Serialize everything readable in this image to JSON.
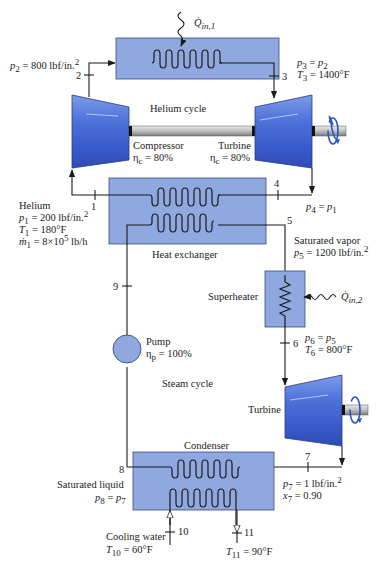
{
  "colors": {
    "box_fill": "#8fa8e0",
    "machine_blue": "#4a6fd6",
    "rotation_arrow": "#2a52c9",
    "shaft_gray": "#b9b9b9",
    "line": "#1a1a1a"
  },
  "components": {
    "helium_heater": {
      "heat_label": "Q̇",
      "heat_sub": "in,1"
    },
    "helium_cycle_label": "Helium cycle",
    "compressor": {
      "label": "Compressor",
      "eff": "ηc = 80%",
      "eff_sym": "η",
      "eff_sub": "c",
      "eff_val": " = 80%"
    },
    "helium_turbine": {
      "label": "Turbine",
      "eff_sym": "η",
      "eff_sub": "c",
      "eff_val": " = 80%"
    },
    "heat_exchanger": {
      "label": "Heat exchanger"
    },
    "superheater": {
      "label": "Superheater",
      "heat_label": "Q̇",
      "heat_sub": "in,2"
    },
    "pump": {
      "label": "Pump",
      "eff_sym": "η",
      "eff_sub": "p",
      "eff_val": " = 100%"
    },
    "steam_cycle_label": "Steam cycle",
    "steam_turbine": {
      "label": "Turbine"
    },
    "condenser": {
      "label": "Condenser"
    }
  },
  "states": {
    "s1": {
      "num": "1",
      "title": "Helium",
      "p": "p",
      "p_sub": "1",
      "p_val": " = 200 lbf/in.",
      "p_exp": "2",
      "T": "T",
      "T_sub": "1",
      "T_val": " = 180°F",
      "m": "ṁ",
      "m_sub": "1",
      "m_val": " = 8×10",
      "m_exp": "5",
      "m_unit": " lb/h"
    },
    "s2": {
      "num": "2",
      "p": "p",
      "p_sub": "2",
      "p_val": " = 800 lbf/in.",
      "p_exp": "2"
    },
    "s3": {
      "num": "3",
      "p": "p",
      "p_sub": "3",
      "p_eq": " = ",
      "p_rhs": "p",
      "p_rhs_sub": "2",
      "T": "T",
      "T_sub": "3",
      "T_val": " = 1400°F"
    },
    "s4": {
      "num": "4",
      "p": "p",
      "p_sub": "4",
      "p_eq": " = ",
      "p_rhs": "p",
      "p_rhs_sub": "1"
    },
    "s5": {
      "num": "5",
      "title": "Saturated vapor",
      "p": "p",
      "p_sub": "5",
      "p_val": " = 1200 lbf/in.",
      "p_exp": "2"
    },
    "s6": {
      "num": "6",
      "p": "p",
      "p_sub": "6",
      "p_eq": " = ",
      "p_rhs": "p",
      "p_rhs_sub": "5",
      "T": "T",
      "T_sub": "6",
      "T_val": " = 800°F"
    },
    "s7": {
      "num": "7",
      "p": "p",
      "p_sub": "7",
      "p_val": " = 1 lbf/in.",
      "p_exp": "2",
      "x": "x",
      "x_sub": "7",
      "x_val": " = 0.90"
    },
    "s8": {
      "num": "8",
      "title": "Saturated liquid",
      "p": "p",
      "p_sub": "8",
      "p_eq": " = ",
      "p_rhs": "p",
      "p_rhs_sub": "7"
    },
    "s9": {
      "num": "9"
    },
    "s10": {
      "num": "10",
      "title": "Cooling water",
      "T": "T",
      "T_sub": "10",
      "T_val": " = 60°F"
    },
    "s11": {
      "num": "11",
      "T": "T",
      "T_sub": "11",
      "T_val": " = 90°F"
    }
  }
}
